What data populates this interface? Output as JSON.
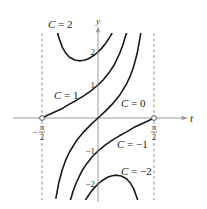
{
  "chart_data": {
    "type": "line",
    "title": "",
    "xlabel": "t",
    "ylabel": "y",
    "xlim": [
      -1.5708,
      1.5708
    ],
    "ylim": [
      -2.5,
      2.6
    ],
    "grid": false,
    "x_tick_labels": [
      {
        "value": -1.5708,
        "num": "π",
        "den": "2",
        "sign": "−"
      },
      {
        "value": 1.5708,
        "num": "π",
        "den": "2",
        "sign": ""
      }
    ],
    "y_tick_labels": [
      {
        "value": 2,
        "label": "2"
      },
      {
        "value": 1,
        "label": "1"
      },
      {
        "value": -1,
        "label": "−1"
      },
      {
        "value": -2,
        "label": "−2"
      }
    ],
    "asymptotes": [
      -1.5708,
      1.5708
    ],
    "open_points": [
      [
        -1.5708,
        0
      ],
      [
        1.5708,
        0
      ]
    ],
    "series": [
      {
        "name": "C = 2",
        "label": "C = 2",
        "label_pos": [
          48,
          28
        ],
        "points": [
          [
            -1.15,
            2.66
          ],
          [
            -1.1,
            2.44
          ],
          [
            -1.0,
            2.14
          ],
          [
            -0.9,
            1.96
          ],
          [
            -0.8,
            1.84
          ],
          [
            -0.65,
            1.76
          ],
          [
            -0.5236,
            1.732
          ],
          [
            -0.4,
            1.75
          ],
          [
            -0.3,
            1.78
          ],
          [
            -0.2,
            1.84
          ],
          [
            -0.1,
            1.91
          ],
          [
            0,
            2.0
          ],
          [
            0.1,
            2.11
          ],
          [
            0.2,
            2.24
          ],
          [
            0.3,
            2.4
          ],
          [
            0.35,
            2.49
          ],
          [
            0.4,
            2.59
          ]
        ]
      },
      {
        "name": "C = 1",
        "label": "C = 1",
        "label_pos": [
          54,
          99
        ],
        "points": [
          [
            -1.5708,
            0
          ],
          [
            -1.4,
            0.09
          ],
          [
            -1.2,
            0.19
          ],
          [
            -1.0,
            0.29
          ],
          [
            -0.8,
            0.42
          ],
          [
            -0.6,
            0.54
          ],
          [
            -0.4,
            0.67
          ],
          [
            -0.2,
            0.82
          ],
          [
            0,
            1.0
          ],
          [
            0.15,
            1.16
          ],
          [
            0.3,
            1.36
          ],
          [
            0.45,
            1.6
          ],
          [
            0.6,
            1.94
          ],
          [
            0.7,
            2.22
          ],
          [
            0.75,
            2.41
          ],
          [
            0.8,
            2.57
          ]
        ]
      },
      {
        "name": "C = 0",
        "label": "C = 0",
        "label_pos": [
          121,
          107
        ],
        "points": [
          [
            -1.18,
            -2.43
          ],
          [
            -1.1,
            -1.96
          ],
          [
            -1.0,
            -1.56
          ],
          [
            -0.9,
            -1.26
          ],
          [
            -0.8,
            -1.03
          ],
          [
            -0.6,
            -0.68
          ],
          [
            -0.4,
            -0.42
          ],
          [
            -0.2,
            -0.2
          ],
          [
            0,
            0
          ],
          [
            0.2,
            0.2
          ],
          [
            0.4,
            0.42
          ],
          [
            0.6,
            0.68
          ],
          [
            0.8,
            1.03
          ],
          [
            0.9,
            1.26
          ],
          [
            1.0,
            1.56
          ],
          [
            1.1,
            1.96
          ],
          [
            1.2,
            2.57
          ]
        ]
      },
      {
        "name": "C = −1",
        "label": "C = −1",
        "label_pos": [
          117,
          148
        ],
        "points": [
          [
            -0.78,
            -2.5
          ],
          [
            -0.75,
            -2.41
          ],
          [
            -0.7,
            -2.22
          ],
          [
            -0.6,
            -1.94
          ],
          [
            -0.45,
            -1.6
          ],
          [
            -0.3,
            -1.36
          ],
          [
            -0.15,
            -1.16
          ],
          [
            0,
            -1.0
          ],
          [
            0.2,
            -0.82
          ],
          [
            0.4,
            -0.67
          ],
          [
            0.6,
            -0.54
          ],
          [
            0.8,
            -0.42
          ],
          [
            1.0,
            -0.29
          ],
          [
            1.2,
            -0.19
          ],
          [
            1.4,
            -0.09
          ],
          [
            1.5708,
            0
          ]
        ]
      },
      {
        "name": "C = −2",
        "label": "C = −2",
        "label_pos": [
          121,
          175
        ],
        "points": [
          [
            -0.4,
            -2.59
          ],
          [
            -0.35,
            -2.49
          ],
          [
            -0.3,
            -2.4
          ],
          [
            -0.2,
            -2.24
          ],
          [
            -0.1,
            -2.11
          ],
          [
            0,
            -2.0
          ],
          [
            0.1,
            -1.91
          ],
          [
            0.2,
            -1.84
          ],
          [
            0.3,
            -1.78
          ],
          [
            0.4,
            -1.75
          ],
          [
            0.5236,
            -1.732
          ],
          [
            0.65,
            -1.76
          ],
          [
            0.8,
            -1.84
          ],
          [
            0.9,
            -1.96
          ],
          [
            1.0,
            -2.14
          ],
          [
            1.1,
            -2.44
          ],
          [
            1.15,
            -2.66
          ]
        ]
      }
    ]
  },
  "layout": {
    "origin_px": [
      98,
      118
    ],
    "px_per_rad": 35.65,
    "px_per_unit_y": 33,
    "plot_top_px": 33,
    "plot_bottom_px": 200
  },
  "colors": {
    "curve": "#1a1a1a",
    "axis": "#9a9a9a",
    "dashed": "#8a8a8a",
    "text": "#222222"
  }
}
